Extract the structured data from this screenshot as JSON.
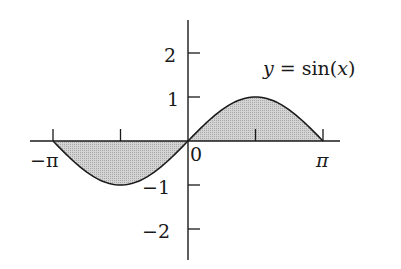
{
  "chart_data": {
    "type": "area",
    "title": "",
    "annotation": "y = sin(x)",
    "function": "sin(x)",
    "xlabel": "",
    "ylabel": "",
    "xlim": [
      -3.14159,
      3.14159
    ],
    "ylim": [
      -2.5,
      2.5
    ],
    "x_ticks": [
      -3.14159,
      -1.5708,
      1.5708,
      3.14159
    ],
    "x_tick_labels": [
      "−π",
      "",
      "",
      "π"
    ],
    "y_ticks": [
      2,
      1,
      -1,
      -2
    ],
    "y_tick_labels": [
      "2",
      "1",
      "−1",
      "−2"
    ],
    "origin_label": "0",
    "grid": false,
    "fill": "shaded region between curve and x-axis",
    "x": [
      -3.14159,
      -2.35619,
      -1.5708,
      -0.7854,
      0,
      0.7854,
      1.5708,
      2.35619,
      3.14159
    ],
    "values": [
      0,
      -0.7071,
      -1,
      -0.7071,
      0,
      0.7071,
      1,
      0.7071,
      0
    ]
  },
  "labels": {
    "annotation_y": "y",
    "annotation_eq": " = sin(",
    "annotation_x": "x",
    "annotation_close": ")",
    "neg_pi": "−π",
    "pi": "π",
    "zero": "0",
    "y2": "2",
    "y1": "1",
    "ym1": "−1",
    "ym2": "−2"
  },
  "colors": {
    "fill": "#c8c8c8",
    "line": "#1a1a1a"
  }
}
